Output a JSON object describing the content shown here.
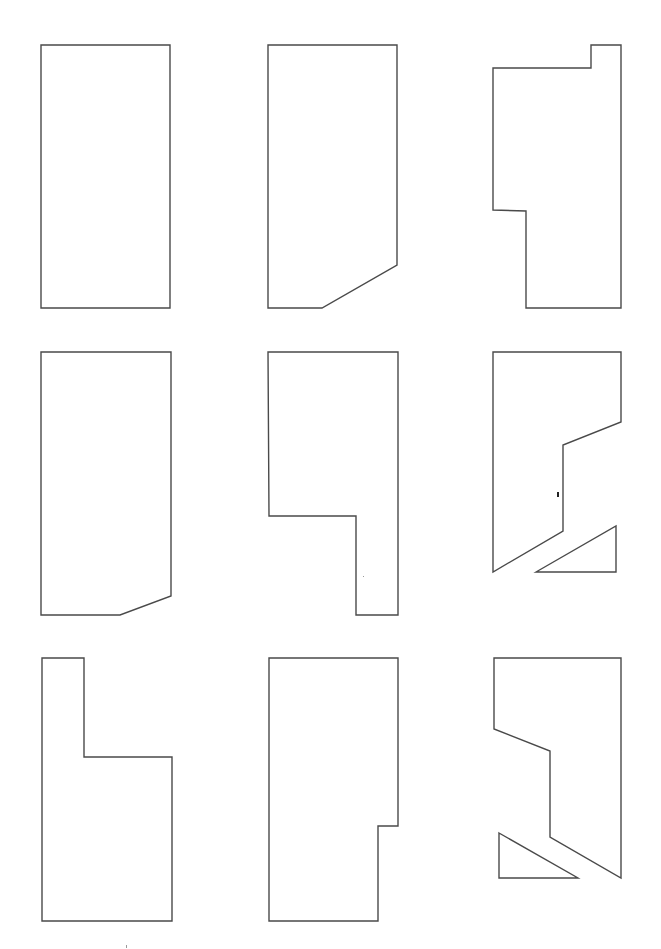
{
  "figure": {
    "width": 661,
    "height": 949,
    "stroke_color": "#4a4a4a",
    "background": "#ffffff",
    "layout": "3x3 grid of outline polygons",
    "panels": [
      {
        "id": "r1c1",
        "row": 1,
        "col": 1,
        "description": "plain rectangle",
        "polygons": [
          "41,45 170,45 170,308 41,308"
        ]
      },
      {
        "id": "r1c2",
        "row": 1,
        "col": 2,
        "description": "rectangle with beveled bottom-right corner",
        "polygons": [
          "268,45 397,45 397,265 322,308 268,308"
        ]
      },
      {
        "id": "r1c3",
        "row": 1,
        "col": 3,
        "description": "tall shape with top-right tab and lower-left notch",
        "polygons": [
          "591,45 621,45 621,308 526,308 526,211 493,210 493,68 591,68"
        ]
      },
      {
        "id": "r2c1",
        "row": 2,
        "col": 1,
        "description": "rectangle with small bevel at bottom-right",
        "polygons": [
          "41,352 171,352 171,596 120,615 41,615"
        ]
      },
      {
        "id": "r2c2",
        "row": 2,
        "col": 2,
        "description": "rectangle with lower-left notch removed",
        "polygons": [
          "268,352 398,352 398,615 356,615 356,516 269,516"
        ]
      },
      {
        "id": "r2c3",
        "row": 2,
        "col": 3,
        "description": "cut shape with separated triangle piece",
        "polygons": [
          "493,352 621,352 621,422 563,445 563,531 493,572",
          "536,572 616,526 616,572"
        ]
      },
      {
        "id": "r3c1",
        "row": 3,
        "col": 1,
        "description": "L-shape with tall left column",
        "polygons": [
          "42,658 84,658 84,757 172,757 172,921 42,921"
        ]
      },
      {
        "id": "r3c2",
        "row": 3,
        "col": 2,
        "description": "rectangle with small lower-right notch",
        "polygons": [
          "269,658 398,658 398,826 378,826 378,921 269,921"
        ]
      },
      {
        "id": "r3c3",
        "row": 3,
        "col": 3,
        "description": "cut shape with separated triangle piece",
        "polygons": [
          "494,658 621,658 621,878 550,837 550,751 494,729",
          "499,833 578,878 499,878"
        ]
      }
    ],
    "artifacts": [
      {
        "type": "ink-mark",
        "x": 557,
        "y": 492,
        "w": 2,
        "h": 5
      },
      {
        "type": "speck",
        "x": 363,
        "y": 576,
        "w": 1,
        "h": 1
      },
      {
        "type": "speck",
        "x": 126,
        "y": 945,
        "w": 1,
        "h": 3
      }
    ]
  }
}
